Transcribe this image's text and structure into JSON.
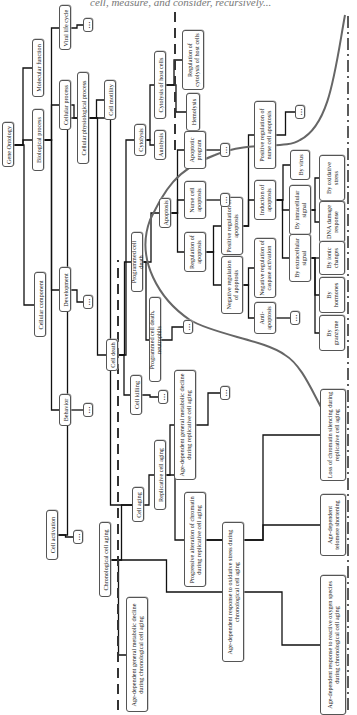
{
  "header": {
    "text": "cell, measure, and consider, recursively..."
  },
  "diagram": {
    "ellipsis": "…",
    "nodes": [
      {
        "id": "gene-ontology",
        "label": "Gene Ontology",
        "cx": 8,
        "cy": 145,
        "w": 12,
        "h": 45
      },
      {
        "id": "biological-process",
        "label": "Biological process",
        "cx": 38,
        "cy": 140,
        "w": 12,
        "h": 62
      },
      {
        "id": "molecular-function",
        "label": "Molecular function",
        "cx": 38,
        "cy": 68,
        "w": 12,
        "h": 58
      },
      {
        "id": "cellular-component",
        "label": "Cellular component",
        "cx": 40,
        "cy": 305,
        "w": 12,
        "h": 65
      },
      {
        "id": "cellular-process",
        "label": "Cellular process",
        "cx": 65,
        "cy": 105,
        "w": 12,
        "h": 50
      },
      {
        "id": "viral-life-cycle",
        "label": "Viral life cycle",
        "cx": 65,
        "cy": 28,
        "w": 12,
        "h": 45
      },
      {
        "id": "development",
        "label": "Development",
        "cx": 65,
        "cy": 290,
        "w": 12,
        "h": 45
      },
      {
        "id": "behavior",
        "label": "Behavior",
        "cx": 65,
        "cy": 410,
        "w": 12,
        "h": 32
      },
      {
        "id": "cellular-physiological-process",
        "label": "Cellular physiological process",
        "cx": 83,
        "cy": 118,
        "w": 12,
        "h": 92
      },
      {
        "id": "cell-motility",
        "label": "Cell motility",
        "cx": 110,
        "cy": 100,
        "w": 12,
        "h": 40
      },
      {
        "id": "cell-death",
        "label": "Cell death",
        "cx": 112,
        "cy": 355,
        "w": 12,
        "h": 32
      },
      {
        "id": "cell-activation",
        "label": "Cell activation",
        "cx": 52,
        "cy": 535,
        "w": 12,
        "h": 50
      },
      {
        "id": "cell-aging",
        "label": "Cell aging",
        "cx": 138,
        "cy": 505,
        "w": 12,
        "h": 35
      },
      {
        "id": "cell-killing",
        "label": "Cell killing",
        "cx": 136,
        "cy": 395,
        "w": 12,
        "h": 40
      },
      {
        "id": "cytolysis",
        "label": "Cytolysis",
        "cx": 140,
        "cy": 140,
        "w": 12,
        "h": 32
      },
      {
        "id": "autolysis",
        "label": "Autolysis",
        "cx": 160,
        "cy": 145,
        "w": 12,
        "h": 30
      },
      {
        "id": "cytolysis-of-host-cells",
        "label": "Cytolysis of host cells",
        "cx": 160,
        "cy": 85,
        "w": 12,
        "h": 68
      },
      {
        "id": "hemolysis",
        "label": "Hemolysis",
        "cx": 193,
        "cy": 112,
        "w": 14,
        "h": 38
      },
      {
        "id": "regulation-of-cytolysis",
        "label": "Regulation of cytolysis of host cells",
        "cx": 193,
        "cy": 60,
        "w": 22,
        "h": 60
      },
      {
        "id": "programmed-cell-death",
        "label": "Programmed cell death",
        "cx": 137,
        "cy": 262,
        "w": 12,
        "h": 60
      },
      {
        "id": "programmed-cell-death-neutrophils",
        "label": "Programmed cell death, neutrophils",
        "cx": 155,
        "cy": 340,
        "w": 12,
        "h": 85
      },
      {
        "id": "apoptosis",
        "label": "Apoptosis",
        "cx": 165,
        "cy": 213,
        "w": 12,
        "h": 30
      },
      {
        "id": "apoptotic-program",
        "label": "Apoptotic program",
        "cx": 195,
        "cy": 150,
        "w": 22,
        "h": 38
      },
      {
        "id": "nurse-cell-apoptosis",
        "label": "Nurse cell apoptosis",
        "cx": 195,
        "cy": 200,
        "w": 22,
        "h": 38
      },
      {
        "id": "regulation-of-apoptosis",
        "label": "Regulation of apoptosis",
        "cx": 195,
        "cy": 252,
        "w": 22,
        "h": 40
      },
      {
        "id": "positive-regulation-of-apoptosis",
        "label": "Positive regulation of apoptosis",
        "cx": 232,
        "cy": 226,
        "w": 22,
        "h": 58
      },
      {
        "id": "negative-regulation-of-apoptosis",
        "label": "Negative regulation of apoptosis",
        "cx": 232,
        "cy": 285,
        "w": 22,
        "h": 58
      },
      {
        "id": "induction-of-apoptosis",
        "label": "Induction of apoptosis",
        "cx": 265,
        "cy": 200,
        "w": 22,
        "h": 40
      },
      {
        "id": "positive-regulation-nurse-cell-apoptosis",
        "label": "Positive regulation of nurse cell apoptosis",
        "cx": 265,
        "cy": 135,
        "w": 22,
        "h": 68
      },
      {
        "id": "negative-regulation-caspase-activation",
        "label": "Negative regulation of caspase activation",
        "cx": 265,
        "cy": 268,
        "w": 22,
        "h": 60
      },
      {
        "id": "anti-apoptosis",
        "label": "Anti-apoptosis",
        "cx": 265,
        "cy": 318,
        "w": 22,
        "h": 32
      },
      {
        "id": "by-virus",
        "label": "By virus",
        "cx": 300,
        "cy": 165,
        "w": 20,
        "h": 30
      },
      {
        "id": "by-intracellular-signal",
        "label": "By intracellular signal",
        "cx": 300,
        "cy": 210,
        "w": 22,
        "h": 50
      },
      {
        "id": "by-extracellular-signal",
        "label": "By extracellular signal",
        "cx": 300,
        "cy": 258,
        "w": 22,
        "h": 48
      },
      {
        "id": "by-oxidative-stress",
        "label": "By oxidative stress",
        "cx": 332,
        "cy": 178,
        "w": 26,
        "h": 46
      },
      {
        "id": "dna-damage-response",
        "label": "DNA damage response",
        "cx": 332,
        "cy": 222,
        "w": 26,
        "h": 42
      },
      {
        "id": "by-ionic-changes",
        "label": "By ionic changes",
        "cx": 332,
        "cy": 258,
        "w": 26,
        "h": 34
      },
      {
        "id": "by-hormones",
        "label": "By hormones",
        "cx": 332,
        "cy": 295,
        "w": 26,
        "h": 36
      },
      {
        "id": "by-granzyme",
        "label": "By granzyme",
        "cx": 332,
        "cy": 333,
        "w": 26,
        "h": 36
      },
      {
        "id": "chronological-cell-aging",
        "label": "Chronological cell aging",
        "cx": 105,
        "cy": 560,
        "w": 12,
        "h": 75
      },
      {
        "id": "replicative-cell-aging",
        "label": "Replicative cell aging",
        "cx": 160,
        "cy": 475,
        "w": 12,
        "h": 70
      },
      {
        "id": "progressive-alteration-chromatin",
        "label": "Progressive alteration of chromatin during replicative cell aging",
        "cx": 195,
        "cy": 540,
        "w": 22,
        "h": 95
      },
      {
        "id": "age-dependent-metabolic-replicative",
        "label": "Age-dependent general metabolic decline during replicative cell aging",
        "cx": 185,
        "cy": 425,
        "w": 22,
        "h": 110
      },
      {
        "id": "age-dependent-metabolic-chronological",
        "label": "Age-dependent general metabolic decline during chronological cell aging",
        "cx": 137,
        "cy": 655,
        "w": 22,
        "h": 115
      },
      {
        "id": "age-dependent-response-oxidative-stress",
        "label": "Age-dependent response to oxidative stress during chronological cell aging",
        "cx": 233,
        "cy": 592,
        "w": 22,
        "h": 140
      },
      {
        "id": "loss-of-chromatin-silencing",
        "label": "Loss of chromatin silencing during replicative cell aging",
        "cx": 333,
        "cy": 435,
        "w": 26,
        "h": 92
      },
      {
        "id": "age-dependent-telomere-shortening",
        "label": "Age-dependent telomere shortening",
        "cx": 333,
        "cy": 525,
        "w": 26,
        "h": 62
      },
      {
        "id": "age-dependent-response-ros",
        "label": "Age-dependent response to reactive oxygen species during chronological cell aging",
        "cx": 333,
        "cy": 645,
        "w": 26,
        "h": 140
      }
    ],
    "ellipsis_nodes": [
      {
        "id": "more-viral-life-cycle",
        "cx": 88,
        "cy": 25
      },
      {
        "id": "more-development",
        "cx": 88,
        "cy": 302
      },
      {
        "id": "more-behavior",
        "cx": 88,
        "cy": 410
      },
      {
        "id": "more-cell-activation",
        "cx": 78,
        "cy": 537
      },
      {
        "id": "more-cell-killing",
        "cx": 163,
        "cy": 397
      },
      {
        "id": "more-programmed-cell-death-neutrophils",
        "cx": 188,
        "cy": 327
      },
      {
        "id": "more-apoptotic-program",
        "cx": 225,
        "cy": 150
      },
      {
        "id": "more-nurse-cell-apoptosis",
        "cx": 225,
        "cy": 200
      },
      {
        "id": "more-positive-regulation-nurse-cell",
        "cx": 300,
        "cy": 112
      },
      {
        "id": "more-anti-apoptosis",
        "cx": 295,
        "cy": 318
      },
      {
        "id": "more-age-dependent-metabolic-replicative",
        "cx": 225,
        "cy": 393
      }
    ],
    "edges": [
      [
        "gene-ontology",
        "biological-process"
      ],
      [
        "gene-ontology",
        "molecular-function"
      ],
      [
        "gene-ontology",
        "cellular-component"
      ],
      [
        "biological-process",
        "cellular-process"
      ],
      [
        "biological-process",
        "viral-life-cycle"
      ],
      [
        "biological-process",
        "development"
      ],
      [
        "biological-process",
        "behavior"
      ],
      [
        "viral-life-cycle",
        "more-viral-life-cycle"
      ],
      [
        "development",
        "more-development"
      ],
      [
        "behavior",
        "more-behavior"
      ],
      [
        "cellular-process",
        "cellular-physiological-process"
      ],
      [
        "cellular-physiological-process",
        "cell-motility"
      ],
      [
        "cellular-physiological-process",
        "cell-death"
      ],
      [
        "cellular-physiological-process",
        "cell-activation"
      ],
      [
        "cellular-physiological-process",
        "cell-aging"
      ],
      [
        "cell-activation",
        "more-cell-activation"
      ],
      [
        "cell-death",
        "cytolysis"
      ],
      [
        "cell-death",
        "programmed-cell-death"
      ],
      [
        "cell-death",
        "cell-killing"
      ],
      [
        "cell-killing",
        "more-cell-killing"
      ],
      [
        "cytolysis",
        "autolysis"
      ],
      [
        "cytolysis",
        "cytolysis-of-host-cells"
      ],
      [
        "cytolysis-of-host-cells",
        "hemolysis"
      ],
      [
        "cytolysis-of-host-cells",
        "regulation-of-cytolysis"
      ],
      [
        "programmed-cell-death",
        "apoptosis"
      ],
      [
        "programmed-cell-death",
        "programmed-cell-death-neutrophils"
      ],
      [
        "programmed-cell-death-neutrophils",
        "more-programmed-cell-death-neutrophils"
      ],
      [
        "apoptosis",
        "apoptotic-program"
      ],
      [
        "apoptosis",
        "nurse-cell-apoptosis"
      ],
      [
        "apoptosis",
        "regulation-of-apoptosis"
      ],
      [
        "apoptotic-program",
        "more-apoptotic-program"
      ],
      [
        "nurse-cell-apoptosis",
        "more-nurse-cell-apoptosis"
      ],
      [
        "regulation-of-apoptosis",
        "positive-regulation-of-apoptosis"
      ],
      [
        "regulation-of-apoptosis",
        "negative-regulation-of-apoptosis"
      ],
      [
        "positive-regulation-of-apoptosis",
        "induction-of-apoptosis"
      ],
      [
        "positive-regulation-of-apoptosis",
        "positive-regulation-nurse-cell-apoptosis"
      ],
      [
        "positive-regulation-nurse-cell-apoptosis",
        "more-positive-regulation-nurse-cell"
      ],
      [
        "negative-regulation-of-apoptosis",
        "negative-regulation-caspase-activation"
      ],
      [
        "negative-regulation-of-apoptosis",
        "anti-apoptosis"
      ],
      [
        "anti-apoptosis",
        "more-anti-apoptosis"
      ],
      [
        "induction-of-apoptosis",
        "by-virus"
      ],
      [
        "induction-of-apoptosis",
        "by-intracellular-signal"
      ],
      [
        "induction-of-apoptosis",
        "by-extracellular-signal"
      ],
      [
        "by-intracellular-signal",
        "by-oxidative-stress"
      ],
      [
        "by-intracellular-signal",
        "dna-damage-response"
      ],
      [
        "by-extracellular-signal",
        "by-ionic-changes"
      ],
      [
        "by-extracellular-signal",
        "by-hormones"
      ],
      [
        "by-extracellular-signal",
        "by-granzyme"
      ],
      [
        "cell-aging",
        "replicative-cell-aging"
      ],
      [
        "cell-aging",
        "chronological-cell-aging"
      ],
      [
        "replicative-cell-aging",
        "age-dependent-metabolic-replicative"
      ],
      [
        "replicative-cell-aging",
        "progressive-alteration-chromatin"
      ],
      [
        "age-dependent-metabolic-replicative",
        "more-age-dependent-metabolic-replicative"
      ],
      [
        "progressive-alteration-chromatin",
        "loss-of-chromatin-silencing"
      ],
      [
        "progressive-alteration-chromatin",
        "age-dependent-telomere-shortening"
      ],
      [
        "chronological-cell-aging",
        "age-dependent-metabolic-chronological"
      ],
      [
        "chronological-cell-aging",
        "age-dependent-response-oxidative-stress"
      ],
      [
        "age-dependent-response-oxidative-stress",
        "age-dependent-response-ros"
      ]
    ],
    "colors": {
      "line": "#111111",
      "node_border": "#555555",
      "curve": "#555555",
      "dash": "#333333"
    }
  }
}
